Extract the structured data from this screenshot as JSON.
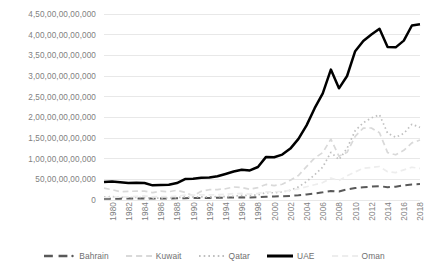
{
  "chart_data": {
    "type": "line",
    "title": "",
    "subtitle": "",
    "xlabel": "",
    "ylabel": "",
    "grid": true,
    "legend_position": "bottom",
    "xlim": [
      1980,
      2019
    ],
    "ylim": [
      0,
      450000000000
    ],
    "x_tick_labels": [
      "1980",
      "1982",
      "1984",
      "1986",
      "1988",
      "1990",
      "1992",
      "1994",
      "1996",
      "1998",
      "2000",
      "2002",
      "2004",
      "2006",
      "2008",
      "2010",
      "2012",
      "2014",
      "2016",
      "2018"
    ],
    "y_tick_labels": [
      "4,50,00,00,00,000",
      "4,00,00,00,00,000",
      "3,50,00,00,00,000",
      "3,00,00,00,00,000",
      "2,50,00,00,00,000",
      "2,00,00,00,00,000",
      "1,50,00,00,00,000",
      "1,00,00,00,00,000",
      "50,00,00,00,000",
      "0"
    ],
    "y_tick_values": [
      450000000000,
      400000000000,
      350000000000,
      300000000000,
      250000000000,
      200000000000,
      150000000000,
      100000000000,
      50000000000,
      0
    ],
    "x": [
      1980,
      1981,
      1982,
      1983,
      1984,
      1985,
      1986,
      1987,
      1988,
      1989,
      1990,
      1991,
      1992,
      1993,
      1994,
      1995,
      1996,
      1997,
      1998,
      1999,
      2000,
      2001,
      2002,
      2003,
      2004,
      2005,
      2006,
      2007,
      2008,
      2009,
      2010,
      2011,
      2012,
      2013,
      2014,
      2015,
      2016,
      2017,
      2018,
      2019
    ],
    "series": [
      {
        "name": "Bahrain",
        "color": "#595959",
        "style": "dashed",
        "marker": "dot",
        "values": [
          3000000000,
          3200000000,
          3300000000,
          3500000000,
          3600000000,
          3700000000,
          3400000000,
          3600000000,
          3800000000,
          4100000000,
          4500000000,
          4600000000,
          4900000000,
          5100000000,
          5400000000,
          5800000000,
          6100000000,
          6400000000,
          6200000000,
          6800000000,
          8000000000,
          8500000000,
          9000000000,
          10000000000,
          11500000000,
          13500000000,
          15900000000,
          18500000000,
          22000000000,
          20600000000,
          25700000000,
          29000000000,
          30800000000,
          32500000000,
          33400000000,
          31100000000,
          32200000000,
          35500000000,
          37700000000,
          38500000000
        ]
      },
      {
        "name": "Kuwait",
        "color": "#d9d9d9",
        "style": "dashed",
        "marker": "none",
        "values": [
          28600000000,
          25000000000,
          20000000000,
          20800000000,
          21500000000,
          21400000000,
          17900000000,
          21300000000,
          20000000000,
          23600000000,
          18300000000,
          10000000000,
          21000000000,
          24900000000,
          25300000000,
          27200000000,
          31500000000,
          30400000000,
          25900000000,
          30100000000,
          37700000000,
          34900000000,
          38100000000,
          47900000000,
          59400000000,
          80800000000,
          101600000000,
          114700000000,
          147400000000,
          105900000000,
          115400000000,
          154000000000,
          174100000000,
          174200000000,
          162600000000,
          114700000000,
          109400000000,
          120100000000,
          138200000000,
          145000000000
        ]
      },
      {
        "name": "Qatar",
        "color": "#bfbfbf",
        "style": "dotted",
        "marker": "none",
        "values": [
          7600000000,
          8100000000,
          6600000000,
          6000000000,
          6100000000,
          5900000000,
          4300000000,
          4700000000,
          5000000000,
          5700000000,
          7400000000,
          6800000000,
          7800000000,
          7400000000,
          8100000000,
          8100000000,
          9100000000,
          11300000000,
          10700000000,
          12400000000,
          17800000000,
          17500000000,
          19500000000,
          23500000000,
          31700000000,
          44500000000,
          60900000000,
          79700000000,
          115300000000,
          97800000000,
          125100000000,
          167800000000,
          186800000000,
          198700000000,
          206200000000,
          161700000000,
          151700000000,
          161100000000,
          183300000000,
          175800000000
        ]
      },
      {
        "name": "UAE",
        "color": "#000000",
        "style": "solid",
        "marker": "none",
        "values": [
          43600000000,
          45000000000,
          43100000000,
          41300000000,
          41800000000,
          41200000000,
          35500000000,
          36400000000,
          36800000000,
          41000000000,
          50700000000,
          51600000000,
          53800000000,
          54400000000,
          57400000000,
          63000000000,
          69000000000,
          73400000000,
          71600000000,
          79800000000,
          104300000000,
          103300000000,
          109800000000,
          124300000000,
          147800000000,
          180600000000,
          222100000000,
          257900000000,
          315500000000,
          270200000000,
          300000000000,
          360100000000,
          384700000000,
          400200000000,
          414100000000,
          370300000000,
          369300000000,
          385600000000,
          422200000000,
          425000000000
        ]
      },
      {
        "name": "Oman",
        "color": "#ededed",
        "style": "dashed",
        "marker": "none",
        "values": [
          6000000000,
          6700000000,
          7200000000,
          7800000000,
          8700000000,
          9900000000,
          7400000000,
          8400000000,
          8200000000,
          9500000000,
          11700000000,
          11800000000,
          12400000000,
          12500000000,
          12900000000,
          13800000000,
          15300000000,
          15800000000,
          14100000000,
          16000000000,
          19500000000,
          19900000000,
          20700000000,
          23200000000,
          27100000000,
          32000000000,
          37000000000,
          42100000000,
          53000000000,
          46900000000,
          58600000000,
          68000000000,
          76900000000,
          78800000000,
          81100000000,
          68400000000,
          66300000000,
          73000000000,
          79300000000,
          76300000000
        ]
      }
    ]
  },
  "legend": {
    "items": [
      {
        "label": "Bahrain"
      },
      {
        "label": "Kuwait"
      },
      {
        "label": "Qatar"
      },
      {
        "label": "UAE"
      },
      {
        "label": "Oman"
      }
    ]
  }
}
